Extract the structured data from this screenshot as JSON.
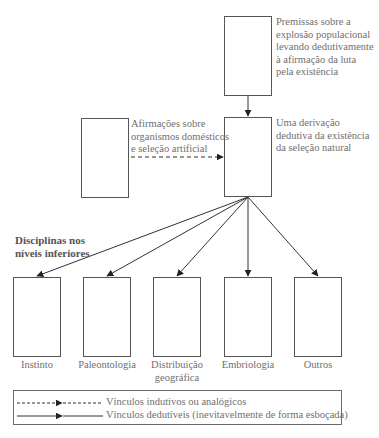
{
  "nodes": {
    "top": {
      "label_lines": [
        "Premissas sobre a",
        "explosão populacional",
        "levando dedutivamente",
        "à afirmação da luta",
        "pela existência"
      ]
    },
    "middle": {
      "label_lines": [
        "Uma derivação",
        "dedutiva da existência",
        "da seleção natural"
      ]
    },
    "left": {
      "label_lines": [
        "Afirmações sobre",
        "organismos domésticos",
        "e seleção artificial"
      ]
    }
  },
  "section_heading": {
    "lines": [
      "Disciplinas nos",
      "níveis inferiores"
    ]
  },
  "disciplines": [
    {
      "label": "Instinto"
    },
    {
      "label": "Paleontologia"
    },
    {
      "label_lines": [
        "Distribuição",
        "geográfica"
      ]
    },
    {
      "label": "Embriologia"
    },
    {
      "label": "Outros"
    }
  ],
  "legend": {
    "items": [
      {
        "style": "dashed-arrow",
        "label": "Vínculos indutivos ou analógicos"
      },
      {
        "style": "solid-arrow",
        "label": "Vínculos dedutíveis (inevitavelmente de forma esboçada)"
      }
    ]
  },
  "colors": {
    "line": "#4a4a4a",
    "text": "#6f6f6f",
    "background": "#ffffff"
  }
}
